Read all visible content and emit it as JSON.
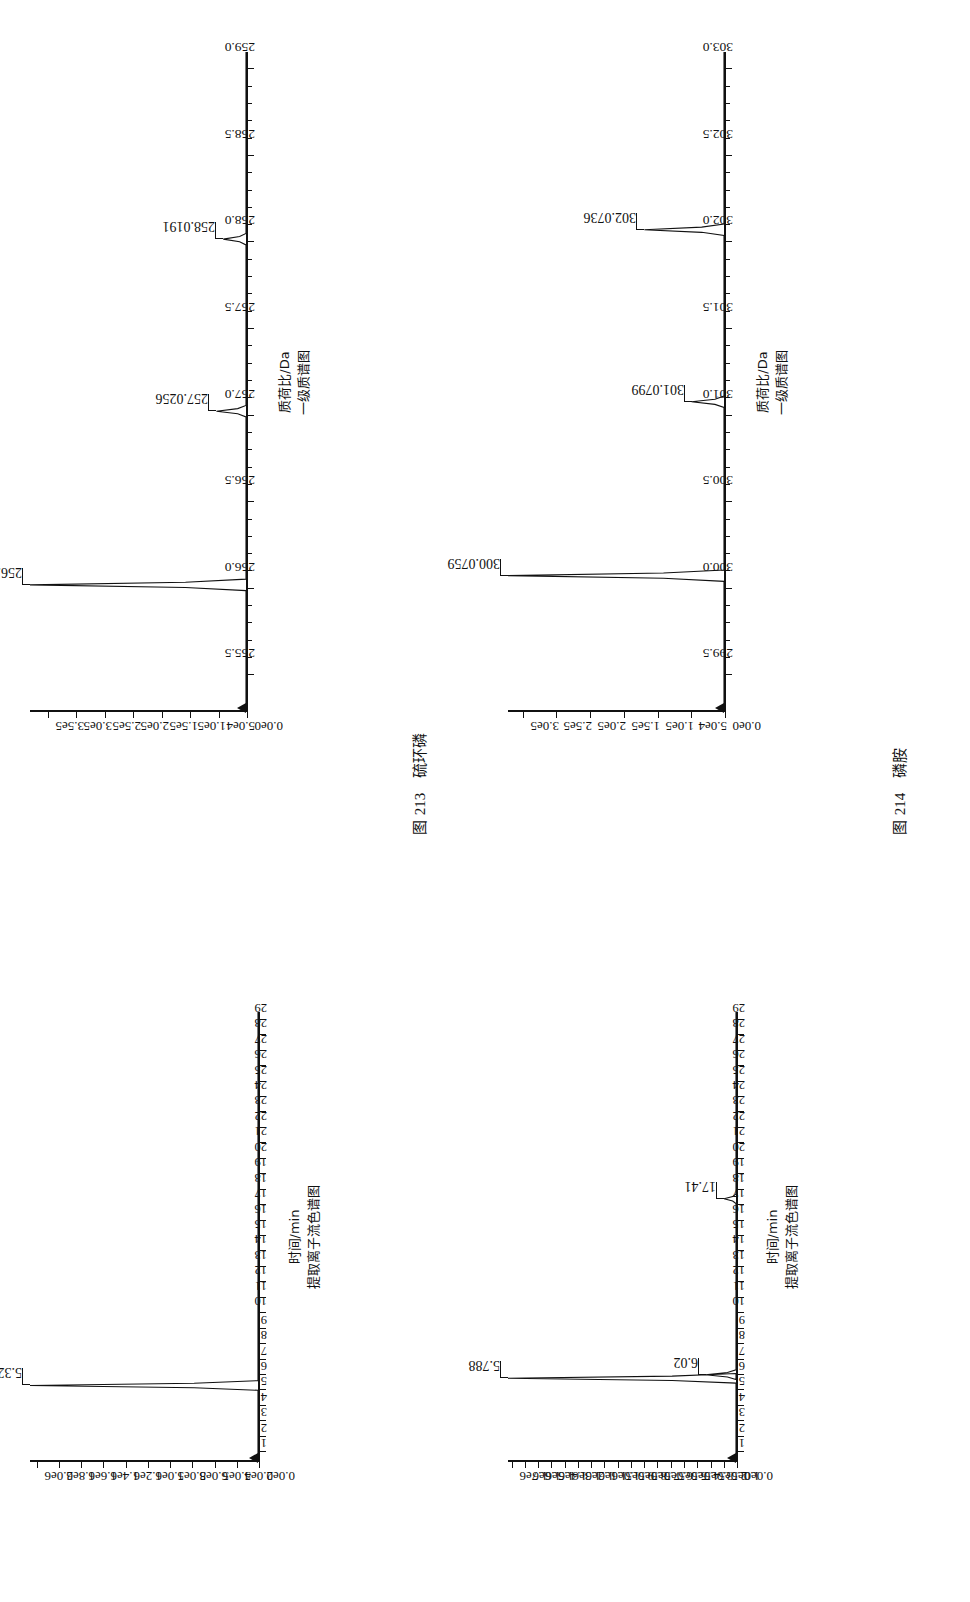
{
  "page": {
    "figures": [
      {
        "id": "fig-213",
        "caption_prefix": "图",
        "caption_number": "213",
        "caption_name": "硫环磷",
        "mass_spectrum": {
          "xlabel_line1": "质荷比/Da",
          "xlabel_line2": "一级质谱图",
          "xticks": [
            "255.5",
            "256.0",
            "256.5",
            "257.0",
            "257.5",
            "258.0",
            "258.5",
            "259.0"
          ],
          "yticks": [
            "0.0e0",
            "5.0e4",
            "1.0e5",
            "1.5e5",
            "2.0e5",
            "2.5e5",
            "3.0e5",
            "3.5e5"
          ],
          "peaks": [
            {
              "label": "256.0226",
              "mz": 256.0226,
              "intensity": 380000
            },
            {
              "label": "257.0256",
              "mz": 257.0256,
              "intensity": 52000
            },
            {
              "label": "258.0191",
              "mz": 258.0191,
              "intensity": 40000
            }
          ]
        },
        "chromatogram": {
          "xlabel_line1": "时间/min",
          "xlabel_line2": "提取离子流色谱图",
          "xticks": [
            "1",
            "2",
            "3",
            "4",
            "5",
            "6",
            "7",
            "8",
            "9",
            "10",
            "11",
            "12",
            "13",
            "14",
            "15",
            "16",
            "17",
            "18",
            "19",
            "20",
            "21",
            "22",
            "23",
            "24",
            "25",
            "26",
            "27",
            "28",
            "29"
          ],
          "yticks": [
            "0.0e0",
            "2.0e5",
            "4.0e5",
            "6.0e5",
            "8.0e5",
            "1.0e6",
            "1.2e6",
            "1.4e6",
            "1.6e6",
            "1.8e6",
            "2.0e6"
          ],
          "peaks": [
            {
              "label": "5.324",
              "time": 5.324,
              "intensity": 2050000
            }
          ]
        }
      },
      {
        "id": "fig-214",
        "caption_prefix": "图",
        "caption_number": "214",
        "caption_name": "磷胺",
        "mass_spectrum": {
          "xlabel_line1": "质荷比/Da",
          "xlabel_line2": "一级质谱图",
          "xticks": [
            "299.5",
            "300.0",
            "300.5",
            "301.0",
            "301.5",
            "302.0",
            "302.5",
            "303.0"
          ],
          "yticks": [
            "0.0e0",
            "5.0e4",
            "1.0e5",
            "1.5e5",
            "2.0e5",
            "2.5e5",
            "3.0e5"
          ],
          "peaks": [
            {
              "label": "300.0759",
              "mz": 300.0759,
              "intensity": 320000
            },
            {
              "label": "301.0799",
              "mz": 301.0799,
              "intensity": 48000
            },
            {
              "label": "302.0736",
              "mz": 302.0736,
              "intensity": 118000
            }
          ]
        },
        "chromatogram": {
          "xlabel_line1": "时间/min",
          "xlabel_line2": "提取离子流色谱图",
          "xticks": [
            "1",
            "2",
            "3",
            "4",
            "5",
            "6",
            "7",
            "8",
            "9",
            "10",
            "11",
            "12",
            "13",
            "14",
            "15",
            "16",
            "17",
            "18",
            "19",
            "20",
            "21",
            "22",
            "23",
            "24",
            "25",
            "26",
            "27",
            "28",
            "29"
          ],
          "yticks": [
            "0.0e0",
            "1.0e5",
            "2.0e5",
            "3.0e5",
            "4.0e5",
            "5.0e5",
            "6.0e5",
            "7.0e5",
            "8.0e5",
            "9.0e5",
            "1.0e6",
            "1.1e6",
            "1.2e6",
            "1.3e6",
            "1.4e6",
            "1.5e6",
            "1.6e6",
            "1.7e6"
          ],
          "peaks": [
            {
              "label": "5.788",
              "time": 5.788,
              "intensity": 1720000
            },
            {
              "label": "6.020",
              "time": 6.02,
              "intensity": 230000
            },
            {
              "label": "17.410",
              "time": 17.41,
              "intensity": 90000
            }
          ]
        }
      }
    ]
  },
  "chart_data": [
    {
      "type": "line",
      "title": "图 213 硫环磷 — 一级质谱图",
      "xlabel": "质荷比/Da",
      "ylabel": "",
      "xlim": [
        255.3,
        259.1
      ],
      "ylim": [
        0,
        380000
      ],
      "xticks": [
        255.5,
        256.0,
        256.5,
        257.0,
        257.5,
        258.0,
        258.5,
        259.0
      ],
      "yticks": [
        0,
        50000,
        100000,
        150000,
        200000,
        250000,
        300000,
        350000
      ],
      "ytick_labels": [
        "0.0e0",
        "5.0e4",
        "1.0e5",
        "1.5e5",
        "2.0e5",
        "2.5e5",
        "3.0e5",
        "3.5e5"
      ],
      "grid": false,
      "legend": "none",
      "x": [
        256.0226,
        257.0256,
        258.0191
      ],
      "y": [
        380000,
        52000,
        40000
      ],
      "annotations": [
        "256.0226",
        "257.0256",
        "258.0191"
      ]
    },
    {
      "type": "line",
      "title": "图 213 硫环磷 — 提取离子流色谱图",
      "xlabel": "时间/min",
      "ylabel": "",
      "xlim": [
        0.5,
        29.5
      ],
      "ylim": [
        0,
        2050000
      ],
      "xticks": [
        1,
        2,
        3,
        4,
        5,
        6,
        7,
        8,
        9,
        10,
        11,
        12,
        13,
        14,
        15,
        16,
        17,
        18,
        19,
        20,
        21,
        22,
        23,
        24,
        25,
        26,
        27,
        28,
        29
      ],
      "yticks": [
        0,
        200000,
        400000,
        600000,
        800000,
        1000000,
        1200000,
        1400000,
        1600000,
        1800000,
        2000000
      ],
      "ytick_labels": [
        "0.0e0",
        "2.0e5",
        "4.0e5",
        "6.0e5",
        "8.0e5",
        "1.0e6",
        "1.2e6",
        "1.4e6",
        "1.6e6",
        "1.8e6",
        "2.0e6"
      ],
      "grid": false,
      "legend": "none",
      "x": [
        5.324
      ],
      "y": [
        2050000
      ],
      "annotations": [
        "5.324"
      ]
    },
    {
      "type": "line",
      "title": "图 214 磷胺 — 一级质谱图",
      "xlabel": "质荷比/Da",
      "ylabel": "",
      "xlim": [
        299.3,
        303.1
      ],
      "ylim": [
        0,
        320000
      ],
      "xticks": [
        299.5,
        300.0,
        300.5,
        301.0,
        301.5,
        302.0,
        302.5,
        303.0
      ],
      "yticks": [
        0,
        50000,
        100000,
        150000,
        200000,
        250000,
        300000
      ],
      "ytick_labels": [
        "0.0e0",
        "5.0e4",
        "1.0e5",
        "1.5e5",
        "2.0e5",
        "2.5e5",
        "3.0e5"
      ],
      "grid": false,
      "legend": "none",
      "x": [
        300.0759,
        301.0799,
        302.0736
      ],
      "y": [
        320000,
        48000,
        118000
      ],
      "annotations": [
        "300.0759",
        "301.0799",
        "302.0736"
      ]
    },
    {
      "type": "line",
      "title": "图 214 磷胺 — 提取离子流色谱图",
      "xlabel": "时间/min",
      "ylabel": "",
      "xlim": [
        0.5,
        29.5
      ],
      "ylim": [
        0,
        1720000
      ],
      "xticks": [
        1,
        2,
        3,
        4,
        5,
        6,
        7,
        8,
        9,
        10,
        11,
        12,
        13,
        14,
        15,
        16,
        17,
        18,
        19,
        20,
        21,
        22,
        23,
        24,
        25,
        26,
        27,
        28,
        29
      ],
      "yticks": [
        0,
        100000,
        200000,
        300000,
        400000,
        500000,
        600000,
        700000,
        800000,
        900000,
        1000000,
        1100000,
        1200000,
        1300000,
        1400000,
        1500000,
        1600000,
        1700000
      ],
      "ytick_labels": [
        "0.0e0",
        "1.0e5",
        "2.0e5",
        "3.0e5",
        "4.0e5",
        "5.0e5",
        "6.0e5",
        "7.0e5",
        "8.0e5",
        "9.0e5",
        "1.0e6",
        "1.1e6",
        "1.2e6",
        "1.3e6",
        "1.4e6",
        "1.5e6",
        "1.6e6",
        "1.7e6"
      ],
      "grid": false,
      "legend": "none",
      "x": [
        5.788,
        6.02,
        17.41
      ],
      "y": [
        1720000,
        230000,
        90000
      ],
      "annotations": [
        "5.788",
        "6.020",
        "17.410"
      ]
    }
  ]
}
